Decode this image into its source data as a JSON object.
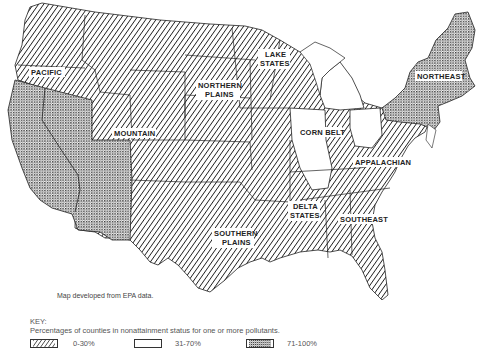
{
  "map": {
    "regions": [
      {
        "name": "PACIFIC",
        "category": "0-30%"
      },
      {
        "name": "MOUNTAIN",
        "category": "0-30%"
      },
      {
        "name": "NORTHERN PLAINS",
        "line1": "NORTHERN",
        "line2": "PLAINS",
        "category": "0-30%"
      },
      {
        "name": "LAKE STATES",
        "line1": "LAKE",
        "line2": "STATES",
        "category": "0-30%"
      },
      {
        "name": "CORN BELT",
        "category": "0-30%"
      },
      {
        "name": "NORTHEAST",
        "category": "71-100%"
      },
      {
        "name": "APPALACHIAN",
        "category": "0-30%"
      },
      {
        "name": "DELTA STATES",
        "line1": "DELTA",
        "line2": "STATES",
        "category": "0-30%"
      },
      {
        "name": "SOUTHEAST",
        "category": "0-30%"
      },
      {
        "name": "SOUTHERN PLAINS",
        "line1": "SOUTHERN",
        "line2": "PLAINS",
        "category": "0-30%"
      }
    ],
    "highlighted_states": {
      "71-100%": [
        "California",
        "Nevada",
        "Arizona",
        "New York",
        "Pennsylvania",
        "New Jersey",
        "New England"
      ],
      "31-70%": [
        "Michigan",
        "Illinois",
        "Ohio"
      ]
    }
  },
  "source_note": "Map developed from EPA data.",
  "key": {
    "title": "KEY:",
    "description": "Percentages of counties in nonattainment status for one or more pollutants.",
    "items": [
      {
        "pattern": "diagonal-hatch",
        "label": "0-30%"
      },
      {
        "pattern": "blank",
        "label": "31-70%"
      },
      {
        "pattern": "stipple",
        "label": "71-100%"
      }
    ]
  },
  "colors": {
    "ink": "#222222",
    "background": "#ffffff"
  }
}
